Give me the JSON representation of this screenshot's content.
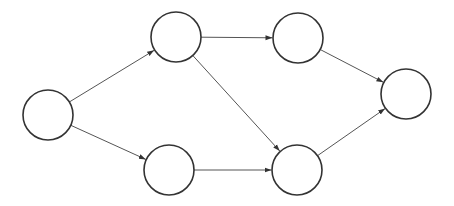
{
  "diagram": {
    "type": "directed-graph",
    "width": 454,
    "height": 206,
    "colors": {
      "background": "#ffffff",
      "node_stroke": "#333333",
      "node_fill": "#ffffff",
      "edge": "#555555",
      "arrowhead": "#333333"
    },
    "node_radius": 25,
    "nodes": [
      {
        "id": "A",
        "label": "",
        "cx": 48,
        "cy": 115
      },
      {
        "id": "B",
        "label": "",
        "cx": 176,
        "cy": 37
      },
      {
        "id": "C",
        "label": "",
        "cx": 169,
        "cy": 170
      },
      {
        "id": "D",
        "label": "",
        "cx": 298,
        "cy": 38
      },
      {
        "id": "E",
        "label": "",
        "cx": 297,
        "cy": 170
      },
      {
        "id": "F",
        "label": "",
        "cx": 406,
        "cy": 94
      }
    ],
    "edges": [
      {
        "from": "A",
        "to": "B"
      },
      {
        "from": "A",
        "to": "C"
      },
      {
        "from": "B",
        "to": "D"
      },
      {
        "from": "B",
        "to": "E"
      },
      {
        "from": "C",
        "to": "E"
      },
      {
        "from": "D",
        "to": "F"
      },
      {
        "from": "E",
        "to": "F"
      }
    ]
  }
}
